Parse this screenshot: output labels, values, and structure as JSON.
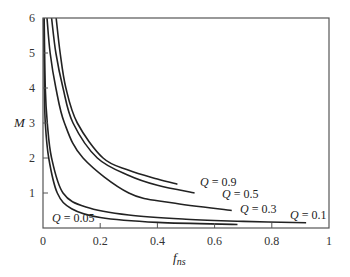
{
  "chart_data": {
    "type": "line",
    "title": "",
    "xlabel": "f_ns",
    "xlabel_main": "f",
    "xlabel_sub": "ns",
    "ylabel": "M",
    "xlim": [
      0,
      1
    ],
    "ylim": [
      0,
      6
    ],
    "xticks": [
      0,
      0.2,
      0.4,
      0.6,
      0.8,
      1
    ],
    "xtick_labels": [
      "0",
      "0.2",
      "0.4",
      "0.6",
      "0.8",
      "1"
    ],
    "yticks": [
      1,
      2,
      3,
      4,
      5,
      6
    ],
    "ytick_labels": [
      "1",
      "2",
      "3",
      "4",
      "5",
      "6"
    ],
    "grid": false,
    "legend": "inline annotations at curve ends",
    "series": [
      {
        "name": "Q = 0.9",
        "q": "0.9",
        "points": [
          [
            0.046,
            6
          ],
          [
            0.06,
            5
          ],
          [
            0.08,
            4
          ],
          [
            0.12,
            3
          ],
          [
            0.21,
            2
          ],
          [
            0.3,
            1.65
          ],
          [
            0.4,
            1.4
          ],
          [
            0.47,
            1.25
          ]
        ],
        "label_pos": [
          0.47,
          1.25
        ]
      },
      {
        "name": "Q = 0.5",
        "q": "0.5",
        "points": [
          [
            0.03,
            6
          ],
          [
            0.045,
            5
          ],
          [
            0.07,
            4
          ],
          [
            0.105,
            3
          ],
          [
            0.19,
            2
          ],
          [
            0.3,
            1.5
          ],
          [
            0.4,
            1.22
          ],
          [
            0.53,
            1.0
          ]
        ],
        "label_pos": [
          0.53,
          1.0
        ]
      },
      {
        "name": "Q = 0.3",
        "q": "0.3",
        "points": [
          [
            0.014,
            6
          ],
          [
            0.025,
            5
          ],
          [
            0.045,
            4
          ],
          [
            0.075,
            3
          ],
          [
            0.14,
            2
          ],
          [
            0.3,
            1.0
          ],
          [
            0.45,
            0.72
          ],
          [
            0.66,
            0.5
          ]
        ],
        "label_pos": [
          0.66,
          0.5
        ]
      },
      {
        "name": "Q = 0.1",
        "q": "0.1",
        "points": [
          [
            0.004,
            6
          ],
          [
            0.008,
            4
          ],
          [
            0.015,
            3
          ],
          [
            0.03,
            2
          ],
          [
            0.07,
            1
          ],
          [
            0.15,
            0.6
          ],
          [
            0.3,
            0.37
          ],
          [
            0.5,
            0.25
          ],
          [
            0.7,
            0.19
          ],
          [
            0.92,
            0.15
          ]
        ],
        "label_pos": [
          0.92,
          0.15
        ]
      },
      {
        "name": "Q = 0.05",
        "q": "0.05",
        "points": [
          [
            0.002,
            6
          ],
          [
            0.005,
            4
          ],
          [
            0.008,
            3
          ],
          [
            0.02,
            2
          ],
          [
            0.05,
            1
          ],
          [
            0.1,
            0.55
          ],
          [
            0.2,
            0.3
          ],
          [
            0.4,
            0.16
          ],
          [
            0.68,
            0.1
          ]
        ],
        "label_pos": [
          0.06,
          0.3
        ]
      }
    ]
  }
}
